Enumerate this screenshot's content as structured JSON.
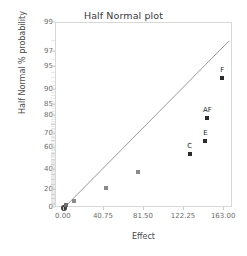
{
  "chart_data": {
    "type": "scatter",
    "title": "Half Normal plot",
    "xlabel": "Effect",
    "ylabel": "Half Normal % probability",
    "xlim": [
      -8,
      172
    ],
    "ylim": [
      0,
      99
    ],
    "grid": false,
    "legend": "none",
    "x_ticks": [
      "0.00",
      "40.75",
      "81.50",
      "122.25",
      "163.00"
    ],
    "x_tick_values": [
      0.0,
      40.75,
      81.5,
      122.25,
      163.0
    ],
    "y_ticks": [
      "0",
      "20",
      "40",
      "60",
      "70",
      "80",
      "85",
      "90",
      "95",
      "97",
      "99"
    ],
    "y_tick_values": [
      0,
      20,
      40,
      60,
      70,
      80,
      85,
      90,
      95,
      97,
      99
    ],
    "points": [
      {
        "label": "",
        "x": 0.0,
        "y": 0,
        "color": "#3f3f3f",
        "size": "large"
      },
      {
        "label": "",
        "x": 2.0,
        "y": 3,
        "color": "#6e6e6e",
        "size": "small"
      },
      {
        "label": "",
        "x": 10.5,
        "y": 8,
        "color": "#8a8a8a",
        "size": "small"
      },
      {
        "label": "",
        "x": 43.0,
        "y": 22,
        "color": "#8a8a8a",
        "size": "small"
      },
      {
        "label": "",
        "x": 75.0,
        "y": 38,
        "color": "#8a8a8a",
        "size": "small"
      },
      {
        "label": "C",
        "x": 128.0,
        "y": 55,
        "color": "#2b2b2b",
        "size": "small"
      },
      {
        "label": "E",
        "x": 144.0,
        "y": 65,
        "color": "#2b2b2b",
        "size": "small"
      },
      {
        "label": "AF",
        "x": 146.0,
        "y": 79,
        "color": "#2b2b2b",
        "size": "small"
      },
      {
        "label": "F",
        "x": 161.0,
        "y": 93,
        "color": "#2b2b2b",
        "size": "small"
      }
    ],
    "reference_line": {
      "x1": 0.0,
      "y1": 0,
      "x2": 168.0,
      "y2": 98,
      "color": "#9a9a9a"
    },
    "colors": {
      "frame": "#d8d8d8",
      "tick": "#6d6d6d",
      "text": "#3a3a3a",
      "line": "#9a9a9a"
    }
  }
}
